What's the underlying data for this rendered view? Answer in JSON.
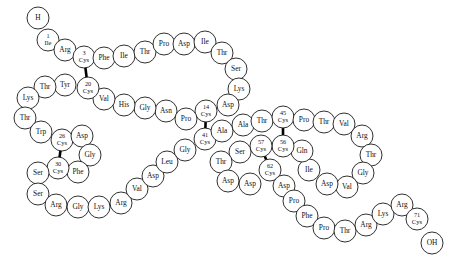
{
  "diagram": {
    "residue_radius": 11.0,
    "circle_stroke": "#1a1a1a",
    "circle_fill": "#ffffff",
    "bond_color": "#000000",
    "background": "#ffffff",
    "terminus_start": {
      "label": "H",
      "x": 38,
      "y": 18
    },
    "terminus_end": {
      "label": "OH",
      "x": 432,
      "y": 243
    },
    "residues": [
      {
        "num": "1",
        "name": "Ile",
        "x": 48,
        "y": 40
      },
      {
        "num": "2",
        "name": "Arg",
        "x": 65,
        "y": 50
      },
      {
        "num": "3",
        "name": "Cys",
        "x": 84,
        "y": 57
      },
      {
        "num": "4",
        "name": "Phe",
        "x": 104,
        "y": 58
      },
      {
        "num": "5",
        "name": "Ile",
        "x": 124,
        "y": 56
      },
      {
        "num": "6",
        "name": "Thr",
        "x": 145,
        "y": 52
      },
      {
        "num": "7",
        "name": "Pro",
        "x": 164,
        "y": 44
      },
      {
        "num": "8",
        "name": "Asp",
        "x": 184,
        "y": 44
      },
      {
        "num": "9",
        "name": "Ile",
        "x": 205,
        "y": 42
      },
      {
        "num": "10",
        "name": "Thr",
        "x": 222,
        "y": 53
      },
      {
        "num": "11",
        "name": "Ser",
        "x": 236,
        "y": 69
      },
      {
        "num": "12",
        "name": "Lys",
        "x": 239,
        "y": 89
      },
      {
        "num": "13",
        "name": "Asp",
        "x": 228,
        "y": 105
      },
      {
        "num": "14",
        "name": "Cys",
        "x": 206,
        "y": 111
      },
      {
        "num": "15",
        "name": "Asn",
        "x": 166,
        "y": 111
      },
      {
        "num": "16",
        "name": "Gly",
        "x": 145,
        "y": 108
      },
      {
        "num": "17",
        "name": "His",
        "x": 124,
        "y": 105
      },
      {
        "num": "18",
        "name": "Val",
        "x": 104,
        "y": 99
      },
      {
        "num": "19",
        "name": "Pro",
        "x": 186,
        "y": 119
      },
      {
        "num": "20",
        "name": "Cys",
        "x": 88,
        "y": 88
      },
      {
        "num": "21",
        "name": "Tyr",
        "x": 65,
        "y": 85
      },
      {
        "num": "22",
        "name": "Thr",
        "x": 45,
        "y": 87
      },
      {
        "num": "23",
        "name": "Lys",
        "x": 28,
        "y": 98
      },
      {
        "num": "24",
        "name": "Thr",
        "x": 25,
        "y": 118
      },
      {
        "num": "25",
        "name": "Trp",
        "x": 41,
        "y": 132
      },
      {
        "num": "26",
        "name": "Cys",
        "x": 62,
        "y": 140
      },
      {
        "num": "27",
        "name": "Asp",
        "x": 82,
        "y": 136
      },
      {
        "num": "28",
        "name": "Gly",
        "x": 90,
        "y": 155
      },
      {
        "num": "29",
        "name": "Phe",
        "x": 78,
        "y": 172
      },
      {
        "num": "30",
        "name": "Cys",
        "x": 58,
        "y": 168
      },
      {
        "num": "31",
        "name": "Ser",
        "x": 38,
        "y": 173
      },
      {
        "num": "32",
        "name": "Ser",
        "x": 38,
        "y": 194
      },
      {
        "num": "33",
        "name": "Arg",
        "x": 56,
        "y": 205
      },
      {
        "num": "34",
        "name": "Gly",
        "x": 78,
        "y": 207
      },
      {
        "num": "35",
        "name": "Lys",
        "x": 99,
        "y": 207
      },
      {
        "num": "36",
        "name": "Arg",
        "x": 121,
        "y": 203
      },
      {
        "num": "37",
        "name": "Val",
        "x": 137,
        "y": 189
      },
      {
        "num": "38",
        "name": "Asp",
        "x": 153,
        "y": 176
      },
      {
        "num": "39",
        "name": "Leu",
        "x": 167,
        "y": 162
      },
      {
        "num": "40",
        "name": "Gly",
        "x": 185,
        "y": 150
      },
      {
        "num": "41",
        "name": "Cys",
        "x": 205,
        "y": 139
      },
      {
        "num": "42",
        "name": "Ala",
        "x": 222,
        "y": 131
      },
      {
        "num": "43",
        "name": "Ala",
        "x": 243,
        "y": 125
      },
      {
        "num": "44",
        "name": "Thr",
        "x": 262,
        "y": 121
      },
      {
        "num": "45",
        "name": "Cys",
        "x": 283,
        "y": 117
      },
      {
        "num": "46",
        "name": "Pro",
        "x": 304,
        "y": 120
      },
      {
        "num": "47",
        "name": "Thr",
        "x": 324,
        "y": 122
      },
      {
        "num": "48",
        "name": "Val",
        "x": 344,
        "y": 124
      },
      {
        "num": "49",
        "name": "Arg",
        "x": 362,
        "y": 136
      },
      {
        "num": "50",
        "name": "Thr",
        "x": 371,
        "y": 155
      },
      {
        "num": "51",
        "name": "Gly",
        "x": 363,
        "y": 173
      },
      {
        "num": "52",
        "name": "Val",
        "x": 347,
        "y": 187
      },
      {
        "num": "53",
        "name": "Asp",
        "x": 327,
        "y": 184
      },
      {
        "num": "54",
        "name": "Ile",
        "x": 309,
        "y": 170
      },
      {
        "num": "55",
        "name": "Gln",
        "x": 302,
        "y": 151
      },
      {
        "num": "56",
        "name": "Cys",
        "x": 283,
        "y": 146
      },
      {
        "num": "57",
        "name": "Cys",
        "x": 261,
        "y": 146
      },
      {
        "num": "58",
        "name": "Ser",
        "x": 240,
        "y": 152
      },
      {
        "num": "59",
        "name": "Thr",
        "x": 221,
        "y": 162
      },
      {
        "num": "60",
        "name": "Asp",
        "x": 228,
        "y": 181
      },
      {
        "num": "61",
        "name": "Asp",
        "x": 250,
        "y": 184
      },
      {
        "num": "62",
        "name": "Cys",
        "x": 270,
        "y": 170
      },
      {
        "num": "63",
        "name": "Asp",
        "x": 284,
        "y": 186
      },
      {
        "num": "64",
        "name": "Pro",
        "x": 294,
        "y": 201
      },
      {
        "num": "65",
        "name": "Phe",
        "x": 307,
        "y": 216
      },
      {
        "num": "66",
        "name": "Pro",
        "x": 324,
        "y": 228
      },
      {
        "num": "67",
        "name": "Thr",
        "x": 345,
        "y": 231
      },
      {
        "num": "68",
        "name": "Arg",
        "x": 366,
        "y": 225
      },
      {
        "num": "69",
        "name": "Lys",
        "x": 383,
        "y": 214
      },
      {
        "num": "70",
        "name": "Arg",
        "x": 402,
        "y": 205
      },
      {
        "num": "71",
        "name": "Cys",
        "x": 417,
        "y": 219
      }
    ],
    "backbone_order": [
      "terminus_start",
      "1",
      "2",
      "3",
      "4",
      "5",
      "6",
      "7",
      "8",
      "9",
      "10",
      "11",
      "12",
      "13",
      "14",
      "19",
      "15",
      "16",
      "17",
      "18",
      "20",
      "21",
      "22",
      "23",
      "24",
      "25",
      "26",
      "27",
      "28",
      "29",
      "30",
      "31",
      "32",
      "33",
      "34",
      "35",
      "36",
      "37",
      "38",
      "39",
      "40",
      "41",
      "42",
      "43",
      "44",
      "45",
      "46",
      "47",
      "48",
      "49",
      "50",
      "51",
      "52",
      "53",
      "54",
      "55",
      "56",
      "57",
      "58",
      "59",
      "60",
      "61",
      "62",
      "63",
      "64",
      "65",
      "66",
      "67",
      "68",
      "69",
      "70",
      "71",
      "terminus_end"
    ],
    "disulfide_bonds": [
      {
        "from": "3",
        "to": "20",
        "label": "3-20"
      },
      {
        "from": "14",
        "to": "41",
        "label": "14-41"
      },
      {
        "from": "26",
        "to": "30",
        "label": "26-30"
      },
      {
        "from": "45",
        "to": "56",
        "label": "45-56"
      },
      {
        "from": "57",
        "to": "62",
        "label": "57-62"
      }
    ],
    "numbered_residues": [
      "1",
      "3",
      "14",
      "20",
      "26",
      "30",
      "41",
      "45",
      "56",
      "57",
      "62",
      "71"
    ]
  }
}
